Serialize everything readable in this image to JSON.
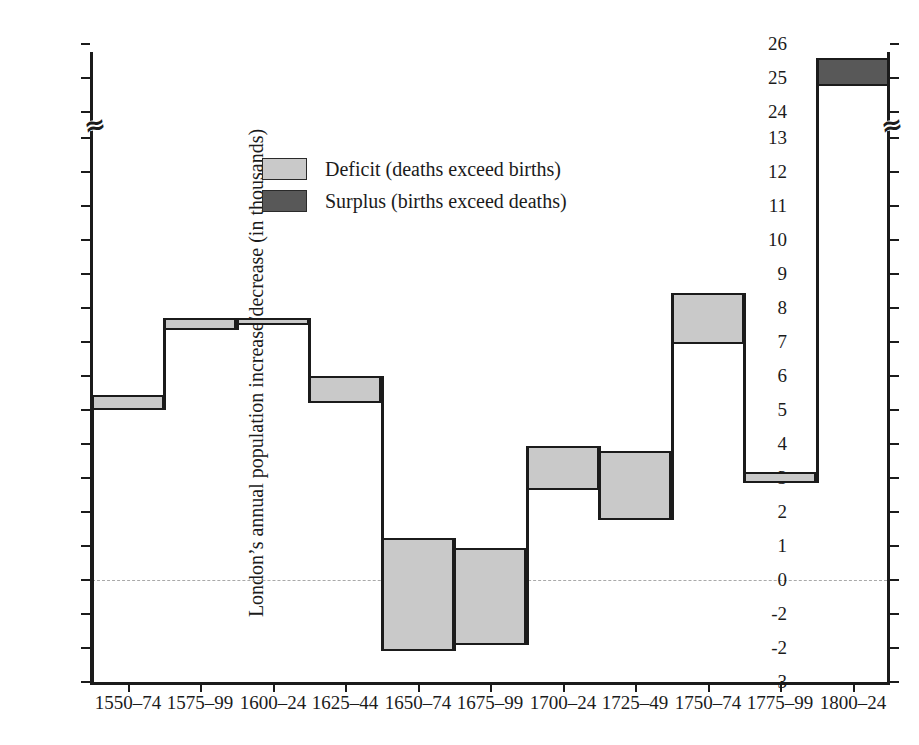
{
  "chart_data": {
    "type": "bar",
    "title": "",
    "subtitle": "",
    "xlabel": "",
    "ylabel": "London's annual population increase/decrease (in thousands)",
    "grid": false,
    "legend_position": "upper-left",
    "axis_note": "y-axis has a break between 13 and 24",
    "ylim": [
      -3,
      26
    ],
    "yticks": [
      -3,
      -2,
      -1,
      0,
      1,
      2,
      3,
      4,
      5,
      6,
      7,
      8,
      9,
      10,
      11,
      12,
      13,
      24,
      25,
      26
    ],
    "ytick_labels": [
      "-3",
      "-2",
      "-2",
      "0",
      "1",
      "2",
      "3",
      "4",
      "5",
      "6",
      "7",
      "8",
      "9",
      "10",
      "11",
      "12",
      "13",
      "24",
      "25",
      "26"
    ],
    "categories": [
      "1550–74",
      "1575–99",
      "1600–24",
      "1625–44",
      "1650–74",
      "1675–99",
      "1700–24",
      "1725–49",
      "1750–74",
      "1775–99",
      "1800–24"
    ],
    "series": [
      {
        "name": "Total increase (band top)",
        "values": [
          5.45,
          7.7,
          7.7,
          6.0,
          1.25,
          0.95,
          3.95,
          3.8,
          8.45,
          13.4,
          25.6
        ]
      },
      {
        "name": "Natural change (band bottom)",
        "values": [
          5.0,
          7.35,
          7.5,
          5.2,
          -2.1,
          -1.9,
          2.65,
          1.75,
          6.95,
          13.1,
          24.75
        ]
      }
    ],
    "band_types": [
      "deficit",
      "deficit",
      "deficit",
      "deficit",
      "deficit",
      "deficit",
      "deficit",
      "deficit",
      "deficit",
      "deficit",
      "surplus"
    ]
  },
  "legend": {
    "items": [
      {
        "type": "deficit",
        "label": "Deficit (deaths exceed births)",
        "color": "#c9c9c9"
      },
      {
        "type": "surplus",
        "label": "Surplus (births exceed deaths)",
        "color": "#585858"
      }
    ]
  },
  "axis": {
    "y_title": "London’s annual population increase/decrease (in thousands)",
    "break_glyph": "≈",
    "zero_line_color": "#a9a9a9"
  }
}
